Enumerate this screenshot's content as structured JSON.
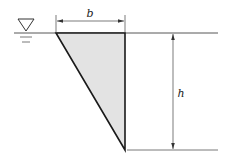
{
  "diagram": {
    "type": "triangular-plate-submerged",
    "labels": {
      "width": "b",
      "height": "h"
    },
    "icons": {
      "free_surface": "free-surface-symbol"
    },
    "colors": {
      "fill": "#e3e3e3",
      "stroke": "#1a1a1a",
      "line": "#555555"
    }
  }
}
